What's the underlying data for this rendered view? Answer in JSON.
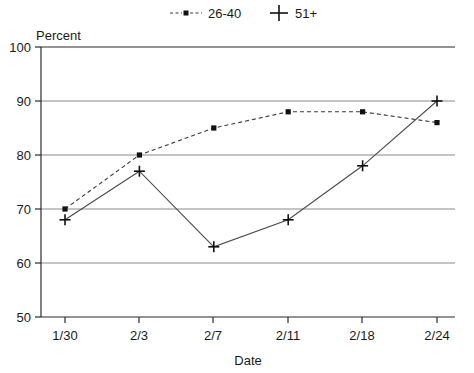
{
  "chart_data": {
    "type": "line",
    "title": "",
    "xlabel": "Date",
    "ylabel": "Percent",
    "categories": [
      "1/30",
      "2/3",
      "2/7",
      "2/11",
      "2/18",
      "2/24"
    ],
    "ylim": [
      50,
      100
    ],
    "yticks": [
      50,
      60,
      70,
      80,
      90,
      100
    ],
    "grid": true,
    "legend_position": "top",
    "series": [
      {
        "name": "26-40",
        "values": [
          70,
          80,
          85,
          88,
          88,
          86
        ],
        "line_style": "dashed",
        "marker": "square",
        "color": "#3a3a3a"
      },
      {
        "name": "51+",
        "values": [
          68,
          77,
          63,
          68,
          78,
          90
        ],
        "line_style": "solid",
        "marker": "plus",
        "color": "#4a4a4a"
      }
    ]
  },
  "labels": {
    "y_axis_title": "Percent",
    "x_axis_title": "Date",
    "y_tick_100": "100",
    "y_tick_90": "90",
    "y_tick_80": "80",
    "y_tick_70": "70",
    "y_tick_60": "60",
    "y_tick_50": "50",
    "x_tick_0": "1/30",
    "x_tick_1": "2/3",
    "x_tick_2": "2/7",
    "x_tick_3": "2/11",
    "x_tick_4": "2/18",
    "x_tick_5": "2/24"
  },
  "legend": {
    "items": [
      {
        "label": "26-40",
        "marker": "dashed-square"
      },
      {
        "label": "51+",
        "marker": "plus"
      }
    ]
  }
}
